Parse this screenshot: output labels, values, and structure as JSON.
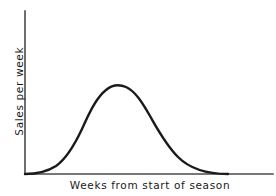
{
  "figure": {
    "background_color": "#ffffff",
    "axis_color": "#4a4a4a",
    "curve_color": "#1a1a1a",
    "width": 276,
    "height": 196
  },
  "chart_data": {
    "type": "line",
    "title": "",
    "subtitle": "",
    "xlabel": "Weeks from start of season",
    "ylabel": "Sales per week",
    "grid": false,
    "legend": null,
    "annotations": [],
    "xticks": [],
    "yticks": [],
    "xticklabels": [],
    "yticklabels": [],
    "axis_style": "two-sided open axes (left and bottom spines only, no tick marks, no tick labels)",
    "xlim": [
      0,
      26
    ],
    "ylim": [
      0,
      100
    ],
    "series": [
      {
        "name": "Sales per week",
        "x": [
          0,
          1,
          2,
          3,
          4,
          5,
          6,
          7,
          8,
          9,
          10,
          11,
          12,
          13,
          14,
          15,
          16,
          17,
          18,
          19,
          20,
          21,
          22,
          23,
          24,
          26
        ],
        "values": [
          0,
          1,
          3,
          6,
          11,
          22,
          40,
          62,
          80,
          88,
          87,
          83,
          76,
          68,
          59,
          50,
          41,
          32,
          24,
          18,
          12,
          8,
          5,
          2,
          0,
          0
        ]
      }
    ],
    "peak": {
      "x": 9,
      "y": 88,
      "label": "peak sales"
    },
    "curve_path": "M 25 174 C 33 174, 45 173, 56 166 C 66 159, 74 146, 82 129 C 90 111, 97 97, 106 90 C 112 85, 119 84, 126 87 C 135 91, 142 102, 150 116 C 158 130, 166 145, 178 157 C 190 169, 208 174, 228 174"
  },
  "axes": {
    "y_axis_path": "M 25 11 L 25 174",
    "x_axis_path": "M 25 174 L 273 174"
  }
}
